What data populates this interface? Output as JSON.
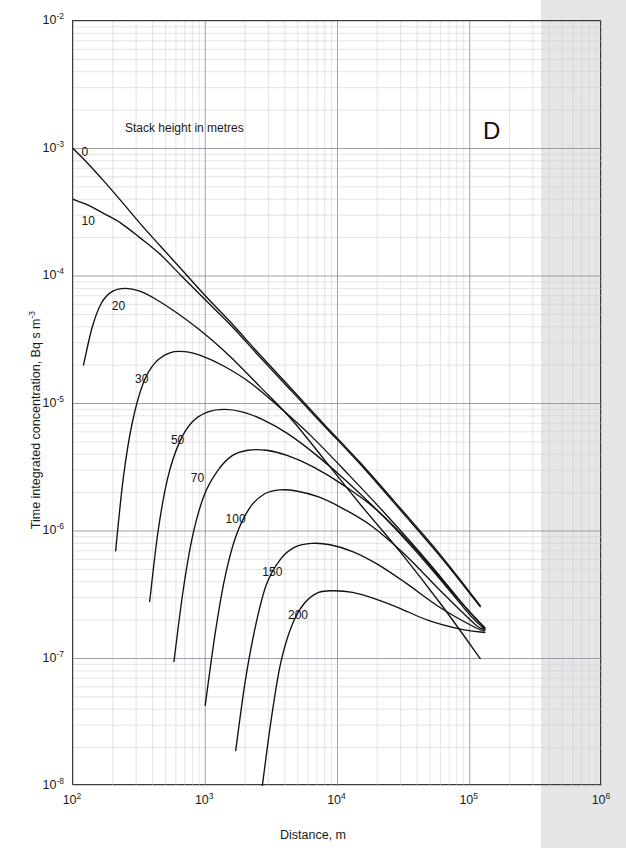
{
  "panel": {
    "letter": "D"
  },
  "axes": {
    "x": {
      "label": "Distance, m",
      "ticks": [
        {
          "text": "10",
          "exp": "2",
          "value": 100
        },
        {
          "text": "10",
          "exp": "3",
          "value": 1000
        },
        {
          "text": "10",
          "exp": "4",
          "value": 10000
        },
        {
          "text": "10",
          "exp": "5",
          "value": 100000
        },
        {
          "text": "10",
          "exp": "6",
          "value": 1000000
        }
      ],
      "min": 100,
      "max": 1000000,
      "scale": "log"
    },
    "y": {
      "label_main": "Time integrated concentration, Bq s m",
      "label_exp": "-3",
      "ticks": [
        {
          "text": "10",
          "exp": "-2",
          "value": 0.01
        },
        {
          "text": "10",
          "exp": "-3",
          "value": 0.001
        },
        {
          "text": "10",
          "exp": "-4",
          "value": 0.0001
        },
        {
          "text": "10",
          "exp": "-5",
          "value": 1e-05
        },
        {
          "text": "10",
          "exp": "-6",
          "value": 1e-06
        },
        {
          "text": "10",
          "exp": "-7",
          "value": 1e-07
        },
        {
          "text": "10",
          "exp": "-8",
          "value": 1e-08
        }
      ],
      "min": 1e-08,
      "max": 0.01,
      "scale": "log"
    }
  },
  "legend_note": "Stack height in metres",
  "colors": {
    "curve": "#111111",
    "frame": "#3a3a3a",
    "major_grid": "#8f95a3",
    "minor_grid": "#c9cdd6",
    "paper_grey": "#e6e6e6",
    "text": "#1a1a1a"
  },
  "chart_data": {
    "type": "line",
    "title": "",
    "subtitle": "Stack height in metres",
    "xlabel": "Distance, m",
    "ylabel": "Time integrated concentration, Bq s m-3",
    "xlim": [
      100,
      1000000
    ],
    "ylim": [
      1e-08,
      0.01
    ],
    "xscale": "log",
    "yscale": "log",
    "grid": true,
    "legend_position": "inline-curve-labels",
    "annotations": [
      {
        "text": "D",
        "x": 380000,
        "y": 0.0015
      },
      {
        "text": "Stack height in metres",
        "x": 260,
        "y": 0.0017
      }
    ],
    "series": [
      {
        "name": "0",
        "label": "0",
        "x": [
          100,
          130,
          170,
          230,
          320,
          450,
          650,
          1000,
          1600,
          2600,
          4500,
          8000,
          15000,
          30000,
          60000,
          120000
        ],
        "y": [
          0.001,
          0.00076,
          0.00056,
          0.00039,
          0.00026,
          0.000175,
          0.000115,
          7e-05,
          4.2e-05,
          2.4e-05,
          1.3e-05,
          6.8e-06,
          3.4e-06,
          1.5e-06,
          6.5e-07,
          2.6e-07
        ]
      },
      {
        "name": "10",
        "label": "10",
        "x": [
          100,
          130,
          170,
          230,
          320,
          450,
          650,
          1000,
          1600,
          2600,
          4500,
          8000,
          15000,
          30000,
          60000,
          120000
        ],
        "y": [
          0.0004,
          0.00036,
          0.00031,
          0.00026,
          0.0002,
          0.00015,
          0.000102,
          6.5e-05,
          4e-05,
          2.3e-05,
          1.25e-05,
          6.6e-06,
          3.3e-06,
          1.45e-06,
          6.3e-07,
          2.55e-07
        ]
      },
      {
        "name": "20",
        "label": "20",
        "x": [
          120,
          140,
          165,
          200,
          250,
          320,
          420,
          600,
          900,
          1500,
          2600,
          4500,
          8000,
          15000,
          30000,
          60000,
          120000
        ],
        "y": [
          2e-05,
          4e-05,
          6.2e-05,
          7.6e-05,
          8e-05,
          7.6e-05,
          6.6e-05,
          5.2e-05,
          3.8e-05,
          2.4e-05,
          1.35e-05,
          7.5e-06,
          3.6e-06,
          1.6e-06,
          6.8e-07,
          2.7e-07,
          1e-07
        ]
      },
      {
        "name": "30",
        "label": "30",
        "x": [
          210,
          240,
          280,
          340,
          420,
          540,
          700,
          950,
          1400,
          2200,
          3800,
          6500,
          12000,
          24000,
          50000,
          100000,
          130000
        ],
        "y": [
          7e-07,
          2.6e-06,
          7e-06,
          1.45e-05,
          2.1e-05,
          2.5e-05,
          2.55e-05,
          2.35e-05,
          1.95e-05,
          1.45e-05,
          9e-06,
          5.4e-06,
          2.8e-06,
          1.3e-06,
          5.5e-07,
          2.3e-07,
          1.75e-07
        ]
      },
      {
        "name": "50",
        "label": "50",
        "x": [
          380,
          440,
          520,
          640,
          800,
          1050,
          1400,
          1900,
          2700,
          4200,
          7000,
          12000,
          24000,
          50000,
          100000,
          130000
        ],
        "y": [
          2.8e-07,
          1e-06,
          2.6e-06,
          5e-06,
          7.2e-06,
          8.6e-06,
          9e-06,
          8.6e-06,
          7.5e-06,
          5.8e-06,
          3.9e-06,
          2.4e-06,
          1.2e-06,
          5.2e-07,
          2.2e-07,
          1.7e-07
        ]
      },
      {
        "name": "70",
        "label": "70",
        "x": [
          580,
          680,
          800,
          980,
          1250,
          1600,
          2100,
          2900,
          4200,
          6500,
          11000,
          20000,
          40000,
          80000,
          120000,
          130000
        ],
        "y": [
          9.5e-08,
          3.4e-07,
          9e-07,
          1.9e-06,
          3e-06,
          3.9e-06,
          4.3e-06,
          4.3e-06,
          3.9e-06,
          3.2e-06,
          2.3e-06,
          1.45e-06,
          7e-07,
          3e-07,
          1.9e-07,
          1.7e-07
        ]
      },
      {
        "name": "100",
        "label": "100",
        "x": [
          1000,
          1180,
          1400,
          1700,
          2150,
          2800,
          3700,
          5000,
          7200,
          11000,
          18000,
          32000,
          60000,
          110000,
          130000
        ],
        "y": [
          4.3e-08,
          1.5e-07,
          4.2e-07,
          9e-07,
          1.5e-06,
          1.95e-06,
          2.1e-06,
          2.05e-06,
          1.85e-06,
          1.5e-06,
          1.1e-06,
          6.6e-07,
          3.4e-07,
          1.85e-07,
          1.7e-07
        ]
      },
      {
        "name": "150",
        "label": "150",
        "x": [
          1700,
          2000,
          2400,
          2900,
          3700,
          4800,
          6400,
          8800,
          13000,
          20000,
          33000,
          60000,
          110000,
          130000
        ],
        "y": [
          1.9e-08,
          6.5e-08,
          1.8e-07,
          3.8e-07,
          6e-07,
          7.5e-07,
          8e-07,
          7.8e-07,
          6.9e-07,
          5.5e-07,
          3.9e-07,
          2.5e-07,
          1.75e-07,
          1.65e-07
        ]
      },
      {
        "name": "200",
        "label": "200",
        "x": [
          2700,
          3150,
          3700,
          4500,
          5600,
          7200,
          9500,
          13000,
          19000,
          29000,
          48000,
          85000,
          130000
        ],
        "y": [
          1e-08,
          3.3e-08,
          9e-08,
          1.8e-07,
          2.7e-07,
          3.3e-07,
          3.4e-07,
          3.3e-07,
          2.95e-07,
          2.5e-07,
          2e-07,
          1.7e-07,
          1.6e-07
        ]
      }
    ],
    "curve_label_positions": [
      {
        "name": "0",
        "x": 118,
        "y": 0.0009
      },
      {
        "name": "10",
        "x": 118,
        "y": 0.00026
      },
      {
        "name": "20",
        "x": 200,
        "y": 5.6e-05
      },
      {
        "name": "30",
        "x": 300,
        "y": 1.5e-05
      },
      {
        "name": "50",
        "x": 560,
        "y": 5e-06
      },
      {
        "name": "70",
        "x": 790,
        "y": 2.5e-06
      },
      {
        "name": "100",
        "x": 1450,
        "y": 1.2e-06
      },
      {
        "name": "150",
        "x": 2750,
        "y": 4.6e-07
      },
      {
        "name": "200",
        "x": 4300,
        "y": 2.1e-07
      }
    ]
  }
}
